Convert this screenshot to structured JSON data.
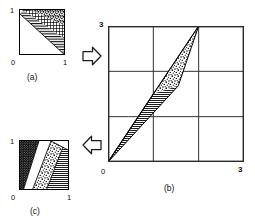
{
  "figure": {
    "type": "mathematical-diagram",
    "background_color": "#ffffff",
    "ink_color": "#000000"
  },
  "panel_a": {
    "caption": "(a)",
    "x_axis": {
      "min_label": "0",
      "max_label": "1"
    },
    "y_axis": {
      "min_label": "",
      "max_label": "1"
    },
    "regions": [
      {
        "name": "stipple-band",
        "texture": "stipple",
        "position": "upper-left diagonal band"
      },
      {
        "name": "crosshatch-band",
        "texture": "cross-hatch",
        "position": "middle diagonal band"
      },
      {
        "name": "horizontal-band",
        "texture": "horizontal-lines",
        "position": "lower diagonal band"
      },
      {
        "name": "blank-triangle",
        "texture": "none",
        "position": "below main diagonal"
      }
    ]
  },
  "panel_b": {
    "caption": "(b)",
    "x_axis": {
      "min_label": "0",
      "max_label": "3",
      "range": [
        0,
        3
      ],
      "ticks": [
        0,
        1,
        2,
        3
      ]
    },
    "y_axis": {
      "min_label": "0",
      "max_label": "3",
      "range": [
        0,
        3
      ],
      "ticks": [
        0,
        1,
        2,
        3
      ]
    },
    "grid": true,
    "grid_divisions": 3,
    "regions": [
      {
        "name": "stipple-sliver",
        "texture": "stipple",
        "vertices": [
          [
            1,
            1.5
          ],
          [
            2,
            3
          ],
          [
            1.55,
            1.68
          ]
        ]
      },
      {
        "name": "hatched-sliver",
        "texture": "horizontal-lines",
        "vertices": [
          [
            0,
            0
          ],
          [
            1,
            1.5
          ],
          [
            1.55,
            1.68
          ]
        ]
      },
      {
        "name": "lower-ray",
        "texture": "line",
        "vertices": [
          [
            0,
            0
          ],
          [
            2,
            3
          ]
        ]
      }
    ]
  },
  "panel_c": {
    "caption": "(c)",
    "x_axis": {
      "min_label": "0",
      "max_label": "1"
    },
    "y_axis": {
      "min_label": "",
      "max_label": "1"
    },
    "regions": [
      {
        "name": "dotted-region",
        "texture": "fine-dots",
        "position": "left wedge"
      },
      {
        "name": "blank-wedge",
        "texture": "none",
        "position": "central white wedge"
      },
      {
        "name": "stipple-wedge",
        "texture": "stipple",
        "position": "middle diagonal band"
      },
      {
        "name": "horizontal-wedge",
        "texture": "horizontal-lines",
        "position": "lower-right wedge"
      }
    ]
  },
  "arrows": [
    {
      "name": "arrow-a-to-b",
      "direction": "right",
      "glyph": "arrow-right-outline"
    },
    {
      "name": "arrow-b-to-c",
      "direction": "left",
      "glyph": "arrow-left-outline"
    }
  ]
}
